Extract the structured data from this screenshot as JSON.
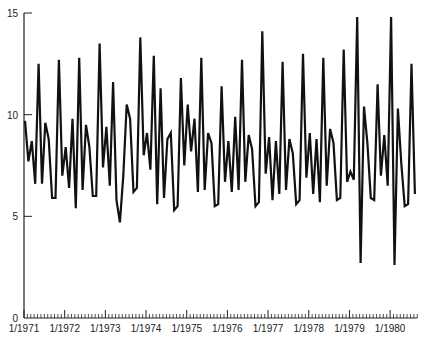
{
  "chart_data": {
    "type": "line",
    "title": "",
    "xlabel": "",
    "ylabel": "",
    "ylim": [
      0,
      15
    ],
    "yticks": [
      0,
      5,
      10,
      15
    ],
    "xtick_labels": [
      "1/1971",
      "1/1972",
      "1/1973",
      "1/1974",
      "1/1975",
      "1/1976",
      "1/1977",
      "1/1978",
      "1/1979",
      "1/1980"
    ],
    "x_start": "1/1971",
    "frequency": "monthly",
    "grid": false,
    "legend": null,
    "series": [
      {
        "name": "series",
        "values": [
          9.7,
          7.7,
          8.7,
          6.6,
          12.5,
          6.6,
          9.6,
          8.8,
          5.9,
          5.9,
          12.7,
          7.0,
          8.4,
          6.4,
          9.8,
          5.4,
          12.8,
          6.3,
          9.5,
          8.4,
          6.0,
          6.0,
          13.5,
          7.4,
          9.4,
          6.5,
          11.6,
          5.8,
          4.7,
          7.0,
          10.5,
          9.8,
          6.2,
          6.4,
          13.8,
          8.0,
          9.1,
          7.3,
          12.9,
          5.6,
          11.3,
          5.9,
          8.8,
          9.1,
          5.3,
          5.5,
          11.8,
          7.5,
          10.5,
          8.2,
          9.8,
          6.2,
          12.8,
          6.3,
          9.1,
          8.6,
          5.5,
          5.6,
          11.4,
          6.7,
          8.7,
          6.2,
          9.9,
          6.3,
          12.7,
          6.7,
          9.0,
          8.3,
          5.5,
          5.7,
          14.1,
          7.1,
          8.9,
          5.8,
          8.7,
          6.1,
          12.6,
          6.3,
          8.8,
          8.1,
          5.6,
          5.8,
          13.0,
          6.9,
          9.1,
          6.1,
          8.8,
          5.7,
          12.8,
          6.5,
          9.3,
          8.6,
          5.8,
          5.9,
          13.2,
          6.7,
          7.2,
          6.8,
          14.8,
          2.7,
          10.4,
          8.6,
          5.9,
          5.8,
          11.5,
          7.0,
          9.0,
          6.5,
          14.8,
          2.6,
          10.3,
          7.6,
          5.5,
          5.6,
          12.5,
          6.1
        ]
      }
    ]
  },
  "axes": {
    "y_labels": [
      "0",
      "5",
      "10",
      "15"
    ],
    "x_labels": [
      "1/1971",
      "1/1972",
      "1/1973",
      "1/1974",
      "1/1975",
      "1/1976",
      "1/1977",
      "1/1978",
      "1/1979",
      "1/1980"
    ]
  }
}
